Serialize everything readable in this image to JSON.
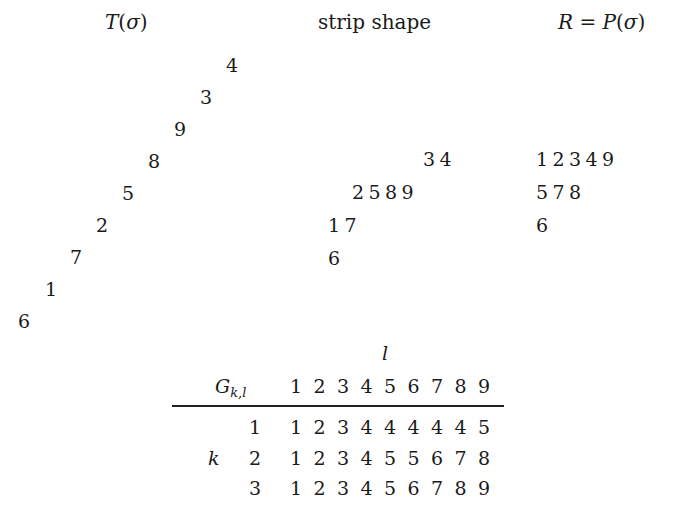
{
  "titles": {
    "left": "T(σ)",
    "left_func": "T",
    "left_arg": "σ",
    "middle": "strip shape",
    "right_lhs": "R",
    "right_eq": " = ",
    "right_func": "P",
    "right_arg": "σ"
  },
  "t_sigma_diagonal": [
    "4",
    "3",
    "9",
    "8",
    "5",
    "2",
    "7",
    "1",
    "6"
  ],
  "strip_shape": {
    "rows": [
      [
        "3",
        "4"
      ],
      [
        "2",
        "5",
        "8",
        "9"
      ],
      [
        "1",
        "7"
      ],
      [
        "6"
      ]
    ]
  },
  "p_sigma": {
    "rows": [
      [
        "1",
        "2",
        "3",
        "4",
        "9"
      ],
      [
        "5",
        "7",
        "8"
      ],
      [
        "6"
      ]
    ]
  },
  "g_table": {
    "col_var": "l",
    "row_var": "k",
    "corner_label": "G",
    "corner_sub": "k,l",
    "columns": [
      "1",
      "2",
      "3",
      "4",
      "5",
      "6",
      "7",
      "8",
      "9"
    ],
    "rows": [
      {
        "k": "1",
        "values": [
          "1",
          "2",
          "3",
          "4",
          "4",
          "4",
          "4",
          "4",
          "5"
        ]
      },
      {
        "k": "2",
        "values": [
          "1",
          "2",
          "3",
          "4",
          "5",
          "5",
          "6",
          "7",
          "8"
        ]
      },
      {
        "k": "3",
        "values": [
          "1",
          "2",
          "3",
          "4",
          "5",
          "6",
          "7",
          "8",
          "9"
        ]
      }
    ]
  }
}
